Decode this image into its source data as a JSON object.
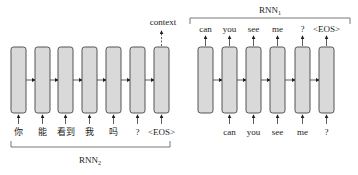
{
  "encoder": {
    "name": "RNN",
    "subscript": "2",
    "inputs": [
      "你",
      "能",
      "看到",
      "我",
      "吗",
      "?",
      "<EOS>"
    ],
    "output_label": "context"
  },
  "decoder": {
    "name": "RNN",
    "subscript": "1",
    "inputs": [
      "can",
      "you",
      "see",
      "me",
      "?"
    ],
    "outputs": [
      "can",
      "you",
      "see",
      "me",
      "?",
      "<EOS>"
    ]
  },
  "colors": {
    "cell_fill": "#d9d9d9",
    "cell_stroke": "#444444",
    "line": "#333333"
  }
}
